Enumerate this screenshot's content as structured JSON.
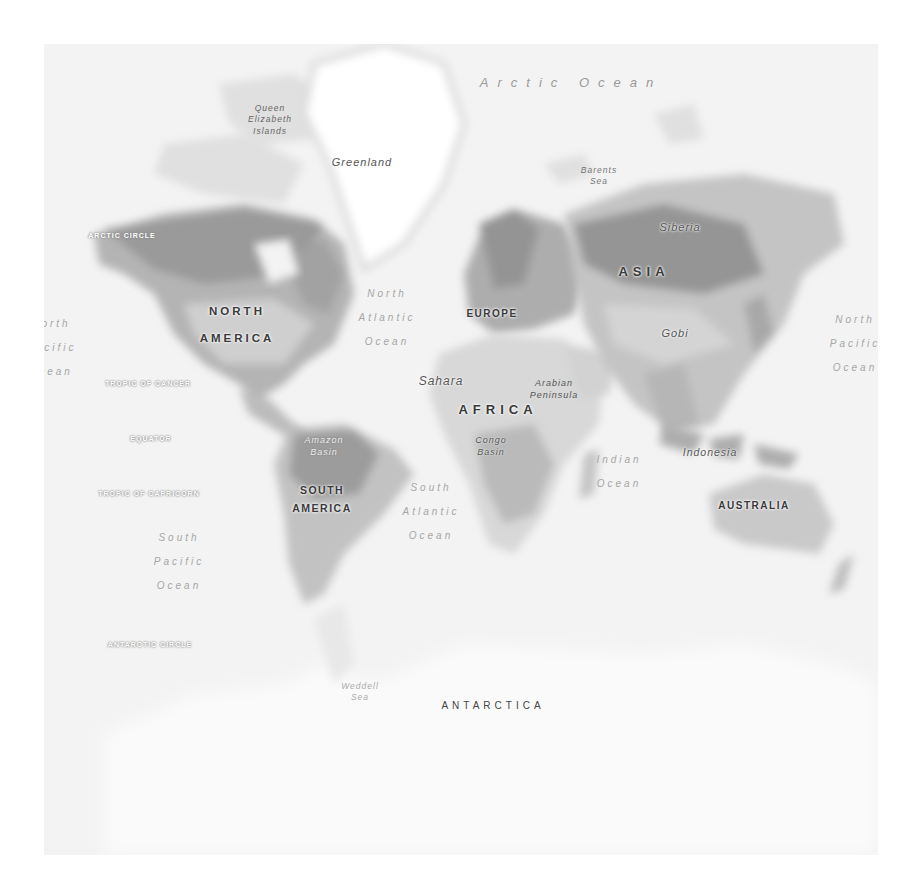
{
  "map": {
    "type": "world-physical-map",
    "style": "grayscale",
    "colors": {
      "ocean": "#f3f3f3",
      "land_light": "#e2e2e2",
      "land_mid": "#c4c4c4",
      "land_dark": "#9c9c9c",
      "ice": "#ffffff",
      "label": "#3a3a3a"
    },
    "oceans": {
      "arctic": "Arctic Ocean",
      "north_atlantic": [
        "North",
        "Atlantic",
        "Ocean"
      ],
      "south_atlantic": [
        "South",
        "Atlantic",
        "Ocean"
      ],
      "north_pacific_west": [
        "orth",
        "acific",
        "cean"
      ],
      "north_pacific_east": [
        "North",
        "Pacific",
        "Ocean"
      ],
      "south_pacific": [
        "South",
        "Pacific",
        "Ocean"
      ],
      "indian": [
        "Indian",
        "Ocean"
      ],
      "barents": [
        "Barents",
        "Sea"
      ],
      "weddell": [
        "Weddell",
        "Sea"
      ]
    },
    "continents": {
      "north_america": [
        "NORTH",
        "AMERICA"
      ],
      "south_america": [
        "SOUTH",
        "AMERICA"
      ],
      "europe": "EUROPE",
      "africa": "AFRICA",
      "asia": "ASIA",
      "australia": "AUSTRALIA",
      "antarctica": "ANTARCTICA"
    },
    "regions": {
      "greenland": "Greenland",
      "queen_elizabeth": [
        "Queen",
        "Elizabeth",
        "Islands"
      ],
      "siberia": "Siberia",
      "gobi": "Gobi",
      "sahara": "Sahara",
      "arabian": [
        "Arabian",
        "Peninsula"
      ],
      "congo": [
        "Congo",
        "Basin"
      ],
      "amazon": [
        "Amazon",
        "Basin"
      ],
      "indonesia": "Indonesia"
    },
    "lines": {
      "arctic_circle": "ARCTIC CIRCLE",
      "tropic_cancer": "TROPIC OF CANCER",
      "equator": "EQUATOR",
      "tropic_capricorn": "TROPIC OF CAPRICORN",
      "antarctic_circle": "ANTARCTIC CIRCLE"
    }
  }
}
